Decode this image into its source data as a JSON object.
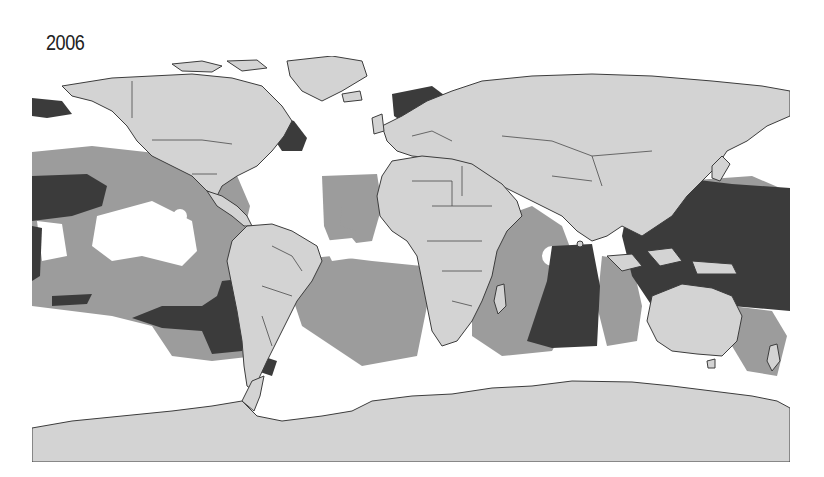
{
  "figure": {
    "year_label": "2006",
    "type": "world-map",
    "projection": "equirectangular",
    "palette": {
      "background_ocean_low": "#ffffff",
      "ocean_medium": "#9c9c9c",
      "ocean_high": "#3b3b3b",
      "land": "#d3d3d3",
      "coastline": "#3c3c3c"
    },
    "regions_shown": [
      "North America",
      "South America",
      "Europe",
      "Africa",
      "Asia",
      "Australia",
      "Antarctica",
      "Greenland"
    ],
    "intensity_zones": {
      "high": [
        "Western Pacific",
        "Eastern Indian Ocean",
        "South-east Pacific (off Peru/Chile)",
        "Central Pacific (north of equator)",
        "North Atlantic (Norway / North Sea)",
        "Northwest Atlantic coast"
      ],
      "medium": [
        "Tropical Pacific",
        "Central Atlantic",
        "South Atlantic",
        "Western Indian Ocean",
        "Northwest Pacific"
      ],
      "low": [
        "Southern Ocean",
        "North Pacific",
        "Central North Atlantic",
        "Eastern Tropical Pacific core"
      ]
    }
  }
}
